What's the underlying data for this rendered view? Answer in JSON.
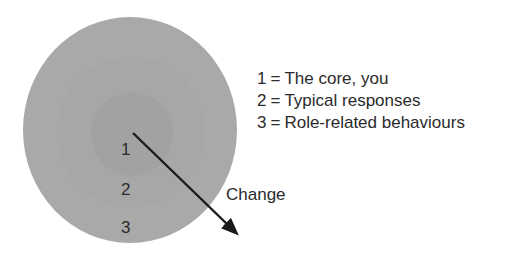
{
  "diagram": {
    "rings": [
      {
        "number": "1",
        "name": "core-ring",
        "fill": "#a2a2a2"
      },
      {
        "number": "2",
        "name": "middle-ring",
        "fill": "#a7a7a7"
      },
      {
        "number": "3",
        "name": "outer-ring",
        "fill": "#a9a9a9"
      }
    ],
    "arrow": {
      "label": "Change",
      "color": "#1a1a1a",
      "from": {
        "x": 133,
        "y": 133
      },
      "to": {
        "x": 236,
        "y": 233
      }
    },
    "legend": {
      "separator": "=",
      "entries": [
        {
          "key": "1",
          "text": "The core, you"
        },
        {
          "key": "2",
          "text": "Typical responses"
        },
        {
          "key": "3",
          "text": "Role-related behaviours"
        }
      ]
    }
  },
  "colors": {
    "background": "#ffffff",
    "text": "#2b2b2b",
    "arrow": "#1a1a1a"
  }
}
